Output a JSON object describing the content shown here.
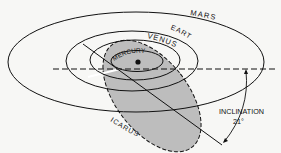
{
  "diagram": {
    "labels": {
      "mars": "MARS",
      "earth": "EARTH",
      "venus": "VENUS",
      "mercury": "MERCURY",
      "icarus": "ICARUS",
      "inclination_label": "INCLINATION",
      "inclination_value": "21°"
    },
    "colors": {
      "background": "#f7f7f5",
      "line": "#111111",
      "icarus_fill": "#bdbdbd",
      "highlight": "#ffffff"
    }
  }
}
